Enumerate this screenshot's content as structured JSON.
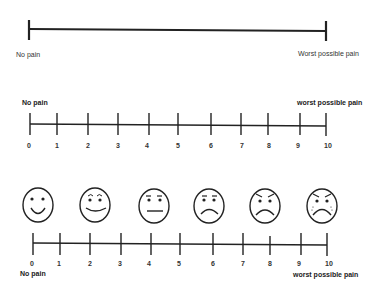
{
  "scale1": {
    "type": "visual-analog-scale",
    "left_label": "No pain",
    "right_label": "Worst possible pain"
  },
  "scale2": {
    "type": "numeric-rating-scale",
    "left_label": "No pain",
    "right_label": "worst possible pain",
    "ticks": [
      "0",
      "1",
      "2",
      "3",
      "4",
      "5",
      "6",
      "7",
      "8",
      "9",
      "10"
    ]
  },
  "scale3": {
    "type": "faces-pain-scale",
    "left_label": "No pain",
    "right_label": "worst possible pain",
    "ticks": [
      "0",
      "1",
      "2",
      "3",
      "4",
      "5",
      "6",
      "7",
      "8",
      "9",
      "10"
    ],
    "faces": [
      {
        "icon": "smiling-face-icon",
        "value": "0"
      },
      {
        "icon": "slight-smile-face-icon",
        "value": "2"
      },
      {
        "icon": "neutral-face-icon",
        "value": "4"
      },
      {
        "icon": "frowning-face-icon",
        "value": "6"
      },
      {
        "icon": "angry-frowning-face-icon",
        "value": "8"
      },
      {
        "icon": "crying-face-icon",
        "value": "10"
      }
    ]
  },
  "colors": {
    "line": "#222222",
    "background": "#ffffff"
  }
}
